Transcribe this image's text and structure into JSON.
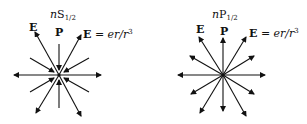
{
  "panels": [
    {
      "title_prefix": "n",
      "title_letter": "S",
      "title_sub": "1/2",
      "label_E": "E",
      "label_P": "P",
      "eq_E": "E",
      "eq_rest": " = er/r",
      "eq_sup": "3",
      "arrow_style": "inward diagonals + outward long"
    },
    {
      "title_prefix": "n",
      "title_letter": "P",
      "title_sub": "1/2",
      "label_E": "E",
      "label_P": "P",
      "eq_E": "E",
      "eq_rest": " = er/r",
      "eq_sup": "3",
      "arrow_style": "all outward"
    }
  ],
  "colors": {
    "ink": "#111111",
    "background": "#ffffff"
  }
}
